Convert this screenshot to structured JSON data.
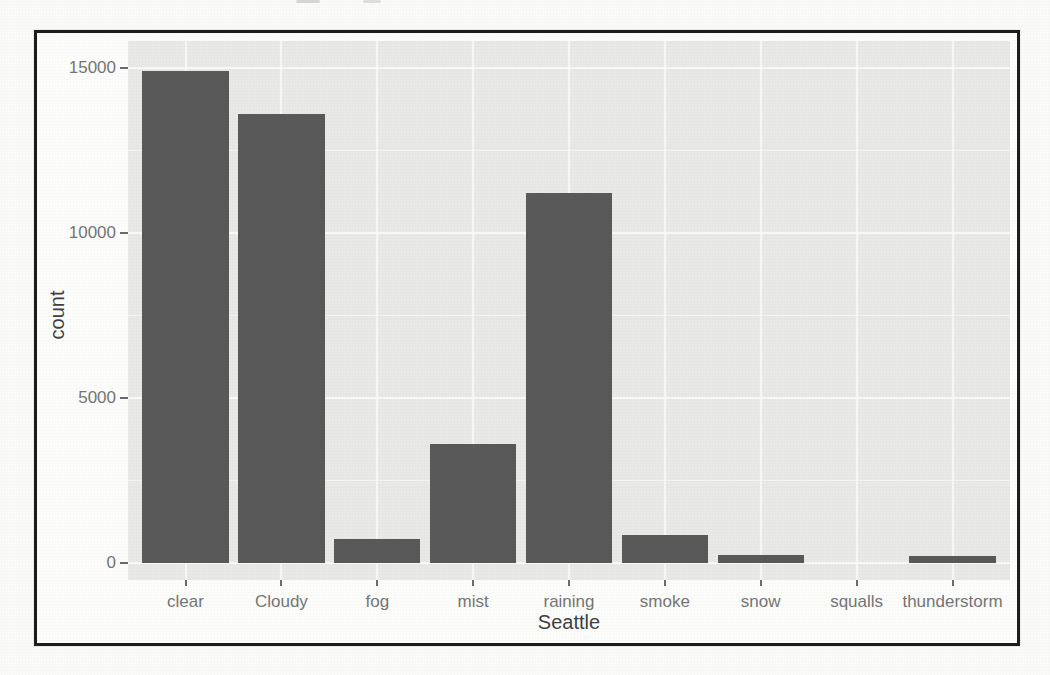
{
  "chart_data": {
    "type": "bar",
    "title": "",
    "xlabel": "Seattle",
    "ylabel": "count",
    "categories": [
      "clear",
      "Cloudy",
      "fog",
      "mist",
      "raining",
      "smoke",
      "snow",
      "squalls",
      "thunderstorm"
    ],
    "values": [
      14900,
      13600,
      730,
      3600,
      11200,
      850,
      230,
      0,
      200
    ],
    "yticks": [
      0,
      5000,
      10000,
      15000
    ],
    "ylim": [
      -500,
      15800
    ],
    "grid": {
      "horizontal_major": true,
      "horizontal_minor": true,
      "vertical_major_per_category": true
    },
    "legend": "none",
    "colors": {
      "bar": "#595959",
      "panel": "#e9e9e7",
      "grid": "#fafaf8",
      "tick": "#6b6b6b",
      "tick_label": "#757575",
      "axis_title": "#3f3f3f",
      "frame_border": "#1d1d1b"
    }
  }
}
